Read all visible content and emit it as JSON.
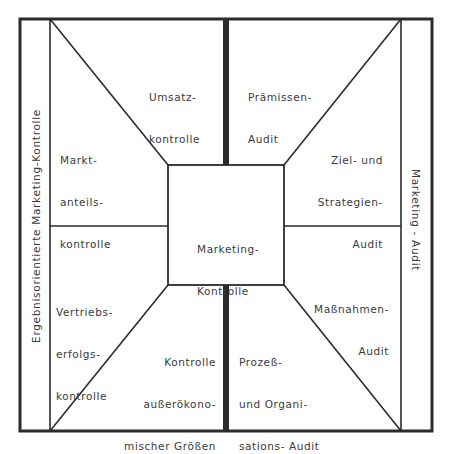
{
  "diagram": {
    "type": "concept-frame",
    "line_color": "#2b2b2b",
    "center": {
      "label_line1": "Marketing-",
      "label_line2": "Kontrolle"
    },
    "side_bands": {
      "left": "Ergebnisorientierte Marketing-Kontrolle",
      "right": "Marketing - Audit"
    },
    "left_half": {
      "top": {
        "line1": "Umsatz-",
        "line2": "kontrolle"
      },
      "upper_left": {
        "line1": "Markt-",
        "line2": "anteils-",
        "line3": "kontrolle"
      },
      "lower_left": {
        "line1": "Vertriebs-",
        "line2": "erfolgs-",
        "line3": "kontrolle"
      },
      "bottom": {
        "line1": "Kontrolle",
        "line2": "außerökono-",
        "line3": "mischer Größen"
      }
    },
    "right_half": {
      "top": {
        "line1": "Prämissen-",
        "line2": "Audit"
      },
      "upper_right": {
        "line1": "Ziel- und",
        "line2": "Strategien-",
        "line3": "Audit"
      },
      "lower_right": {
        "line1": "Maßnahmen-",
        "line2": "Audit"
      },
      "bottom": {
        "line1": "Prozeß-",
        "line2": "und Organi-",
        "line3": "sations- Audit"
      }
    }
  }
}
